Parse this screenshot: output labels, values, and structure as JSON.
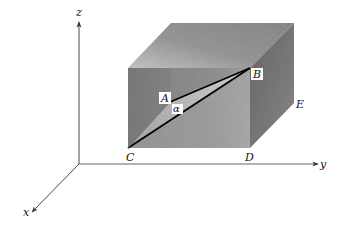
{
  "diagram": {
    "type": "3d-box-geometry",
    "axes": {
      "x": "x",
      "y": "y",
      "z": "z"
    },
    "points": {
      "A": "A",
      "B": "B",
      "C": "C",
      "D": "D",
      "E": "E"
    },
    "angle": "α",
    "segments": [
      {
        "from": "A",
        "to": "B"
      },
      {
        "from": "C",
        "to": "B"
      },
      {
        "from": "C",
        "to": "A"
      }
    ],
    "colors": {
      "front_face": "#8a8a8a",
      "top_face": "#a8a8a8",
      "right_face": "#6f6f6f",
      "triangle_face": "#bdbdbd",
      "lines": "#000000",
      "axes": "#333333"
    }
  }
}
